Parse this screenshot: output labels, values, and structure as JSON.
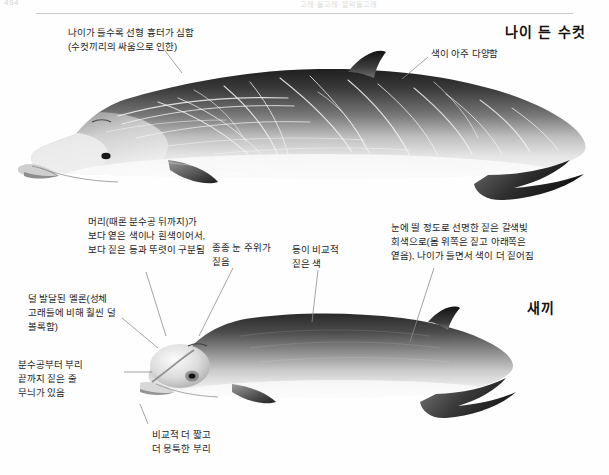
{
  "page": {
    "folio": "494",
    "running_head": "고래·돌고래·알락돌고래"
  },
  "figure": {
    "specimens": [
      {
        "id": "adult-male",
        "label": "나이 든 수컷"
      },
      {
        "id": "calf",
        "label": "새끼"
      }
    ]
  },
  "annotations": {
    "adult": [
      {
        "id": "scarring",
        "text": "나이가 들수록 선형 흉터가 심함\n(수컷끼리의 싸움으로 인한)"
      },
      {
        "id": "color-variable",
        "text": "색이 아주 다양함"
      }
    ],
    "calf": [
      {
        "id": "head-lighter",
        "text": "머리(때론 분수공 뒤까지)가\n보다 옅은 색이나 흰색이어서,\n보다 짙은 등과 뚜렷이 구분됨"
      },
      {
        "id": "dark-eye-patch",
        "text": "종종 눈 주위가\n짙음"
      },
      {
        "id": "dark-back",
        "text": "등이 비교적\n짙은 색"
      },
      {
        "id": "body-color",
        "text": "눈에 띌 정도로 선명한 짙은 갈색빛\n회색으로(몸 위쪽은 짙고 아래쪽은\n옅음), 나이가 들면서 색이 더 짙어짐"
      },
      {
        "id": "melon-underdeveloped",
        "text": "덜 발달된 멜론(성체\n고래들에 비해 훨씬 덜\n볼록함)"
      },
      {
        "id": "blowhole-stripe",
        "text": "분수공부터 부리\n끝까지 짙은 줄\n무늬가 있음"
      },
      {
        "id": "shorter-beak",
        "text": "비교적 더 짧고\n더 뭉툭한 부리"
      }
    ]
  },
  "colors": {
    "page_bg": "#fefefe",
    "text": "#1d1d1d",
    "leader_line": "#8b8b8b",
    "rule": "#c9c9c9",
    "whale_dark": "#2c2c2c",
    "whale_mid": "#7a7a7a",
    "whale_light": "#e8e8e8",
    "scar": "#f2f2f2"
  }
}
